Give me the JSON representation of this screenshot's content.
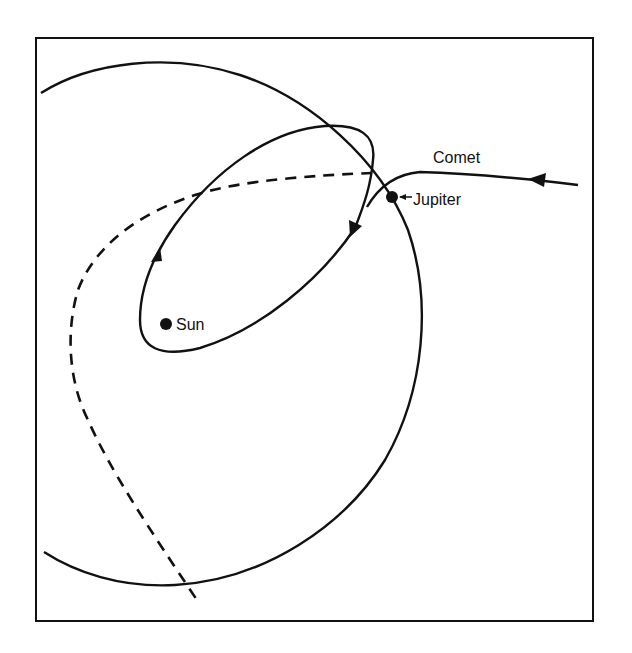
{
  "figure": {
    "type": "orbital-diagram",
    "colors": {
      "ink": "#111111",
      "background": "#ffffff"
    },
    "labels": {
      "comet": "Comet",
      "jupiter": "Jupiter",
      "sun": "Sun"
    },
    "elements": [
      {
        "name": "jupiter-orbit",
        "style": "solid",
        "shape": "large circle"
      },
      {
        "name": "captured-comet-orbit",
        "style": "solid",
        "shape": "ellipse",
        "direction_arrows": 2
      },
      {
        "name": "original-comet-path",
        "style": "dashed",
        "shape": "hyperbola-like curve"
      },
      {
        "name": "incoming-comet-path",
        "style": "solid",
        "direction_arrows": 1
      }
    ],
    "bodies": [
      "Sun",
      "Jupiter"
    ]
  }
}
